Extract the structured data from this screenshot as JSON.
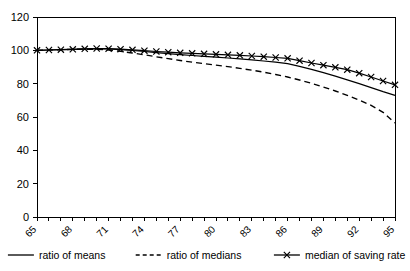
{
  "chart_data": {
    "type": "line",
    "title": "",
    "subtitle": "",
    "xlabel": "",
    "ylabel": "",
    "grid": false,
    "legend_position": "bottom",
    "xlim": [
      65,
      95
    ],
    "ylim": [
      0,
      120
    ],
    "y_ticks": [
      0,
      20,
      40,
      60,
      80,
      100,
      120
    ],
    "x_tick_labels": [
      "65",
      "68",
      "71",
      "74",
      "77",
      "80",
      "83",
      "86",
      "89",
      "92",
      "95"
    ],
    "x_tick_label_rotation": 45,
    "x_tick_label_interval": 3,
    "x": [
      65,
      66,
      67,
      68,
      69,
      70,
      71,
      72,
      73,
      74,
      75,
      76,
      77,
      78,
      79,
      80,
      81,
      82,
      83,
      84,
      85,
      86,
      87,
      88,
      89,
      90,
      91,
      92,
      93,
      94,
      95
    ],
    "series": [
      {
        "name": "ratio of means",
        "style": "solid",
        "marker": "none",
        "color": "#000000",
        "values": [
          100.0,
          100.2,
          100.4,
          100.6,
          100.8,
          100.9,
          100.8,
          100.4,
          99.9,
          99.3,
          98.6,
          98.0,
          97.4,
          96.9,
          96.4,
          95.9,
          95.4,
          94.9,
          94.3,
          93.6,
          92.9,
          92.0,
          90.4,
          88.6,
          86.6,
          84.5,
          82.3,
          80.0,
          77.6,
          75.2,
          73.0
        ]
      },
      {
        "name": "ratio of medians",
        "style": "dashed",
        "marker": "none",
        "color": "#000000",
        "values": [
          100.0,
          100.2,
          100.4,
          100.6,
          100.7,
          100.6,
          100.2,
          99.4,
          98.4,
          97.3,
          96.1,
          95.0,
          93.9,
          92.9,
          92.0,
          91.1,
          90.2,
          89.2,
          88.1,
          86.9,
          85.5,
          84.0,
          82.2,
          80.2,
          78.0,
          75.6,
          73.0,
          70.2,
          67.0,
          62.8,
          56.4
        ]
      },
      {
        "name": "median of saving rate",
        "style": "solid",
        "marker": "x",
        "color": "#000000",
        "values": [
          100.0,
          100.2,
          100.4,
          100.6,
          100.9,
          101.1,
          101.0,
          100.7,
          100.3,
          99.8,
          99.3,
          98.9,
          98.5,
          98.2,
          97.9,
          97.6,
          97.3,
          97.0,
          96.6,
          96.2,
          95.7,
          95.2,
          93.8,
          92.4,
          91.1,
          89.8,
          88.4,
          86.3,
          84.0,
          81.6,
          79.3
        ]
      }
    ],
    "legend": [
      {
        "label": "ratio of means",
        "style": "solid",
        "marker": "none"
      },
      {
        "label": "ratio of medians",
        "style": "dashed",
        "marker": "none"
      },
      {
        "label": "median of saving rate",
        "style": "solid",
        "marker": "x"
      }
    ]
  }
}
